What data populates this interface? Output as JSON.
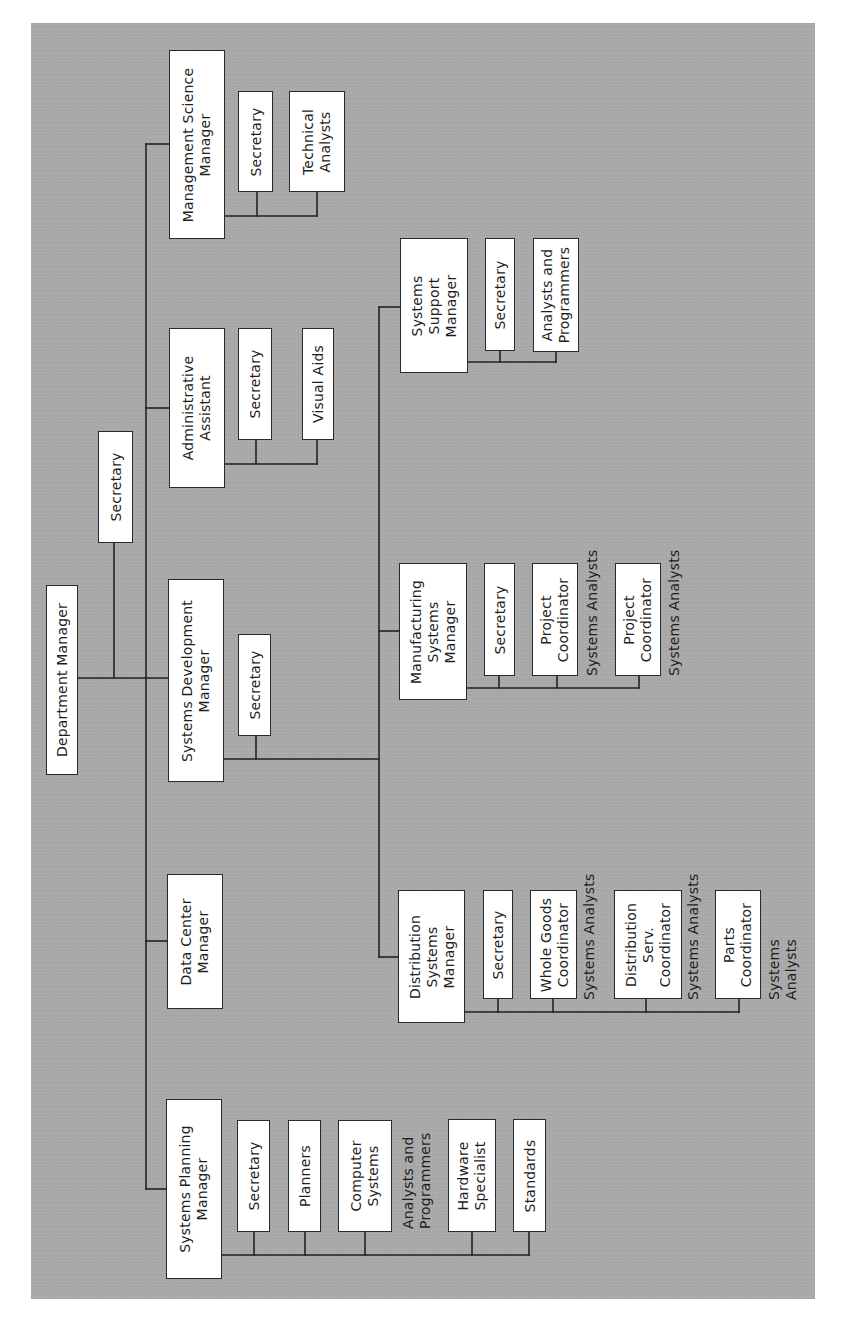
{
  "diagram": {
    "type": "organization-chart",
    "orientation": "rotated 90° counter-clockwise (text reads bottom-to-top)",
    "root": {
      "title": "Department Manager",
      "staff": "Secretary",
      "departments": [
        {
          "title": "Management Science Manager",
          "reports": [
            "Secretary",
            "Technical Analysts"
          ]
        },
        {
          "title": "Administrative Assistant",
          "reports": [
            "Secretary",
            "Visual Aids"
          ]
        },
        {
          "title": "Systems Development Manager",
          "staff": "Secretary",
          "sub_managers": [
            {
              "title": "Systems Support Manager",
              "reports": [
                "Secretary",
                "Analysts and Programmers"
              ]
            },
            {
              "title": "Manufacturing Systems Manager",
              "reports": [
                "Secretary",
                "Project Coordinator",
                "Project Coordinator"
              ],
              "annotations": [
                "Systems Analysts",
                "Systems Analysts"
              ]
            },
            {
              "title": "Distribution Systems Manager",
              "reports": [
                "Secretary",
                "Whole Goods Coordinator",
                "Distribution Serv. Coordinator",
                "Parts Coordinator"
              ],
              "annotations": [
                "Systems Analysts",
                "Systems Analysts",
                "Systems Analysts"
              ]
            }
          ]
        },
        {
          "title": "Data Center Manager",
          "reports": []
        },
        {
          "title": "Systems Planning Manager",
          "reports": [
            "Secretary",
            "Planners",
            "Computer Systems",
            "Hardware Specialist",
            "Standards"
          ],
          "annotations": [
            "Analysts and Programmers"
          ]
        }
      ]
    }
  },
  "boxes": {
    "dept_manager": "Department Manager",
    "dept_secretary": "Secretary",
    "msm": "Management Science\nManager",
    "msm_secretary": "Secretary",
    "msm_tech_analysts": "Technical\nAnalysts",
    "admin_assistant": "Administrative\nAssistant",
    "admin_secretary": "Secretary",
    "admin_visual_aids": "Visual Aids",
    "sdm": "Systems Development\nManager",
    "sdm_secretary": "Secretary",
    "ssm": "Systems\nSupport\nManager",
    "ssm_secretary": "Secretary",
    "ssm_analysts": "Analysts and\nProgrammers",
    "mfg": "Manufacturing\nSystems\nManager",
    "mfg_secretary": "Secretary",
    "mfg_pc1": "Project\nCoordinator",
    "mfg_pc2": "Project\nCoordinator",
    "dist": "Distribution\nSystems\nManager",
    "dist_secretary": "Secretary",
    "dist_whole_goods": "Whole Goods\nCoordinator",
    "dist_serv": "Distribution\nServ.\nCoordinator",
    "dist_parts": "Parts\nCoordinator",
    "dcm": "Data Center\nManager",
    "spm": "Systems Planning\nManager",
    "spm_secretary": "Secretary",
    "spm_planners": "Planners",
    "spm_computer_systems": "Computer\nSystems",
    "spm_hardware": "Hardware\nSpecialist",
    "spm_standards": "Standards"
  },
  "labels": {
    "mfg_sa1": "Systems Analysts",
    "mfg_sa2": "Systems Analysts",
    "dist_sa1": "Systems Analysts",
    "dist_sa2": "Systems Analysts",
    "dist_sa3": "Systems Analysts",
    "spm_ap": "Analysts and\nProgrammers"
  },
  "colors": {
    "background": "#a9a9a9",
    "box_fill": "#ffffff",
    "line": "#222222",
    "text": "#1e1e1e"
  }
}
